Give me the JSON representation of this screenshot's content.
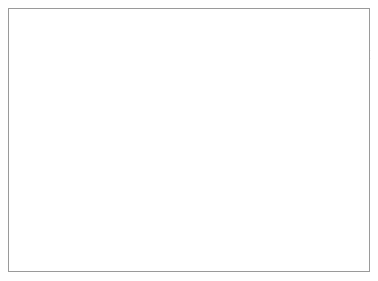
{
  "figure": {
    "kind": "medical-line-drawing",
    "style": "black-and-white pen-and-ink hatching",
    "background_color": "#ffffff",
    "ink_color": "#121212",
    "border_color": "#9a9a9a"
  },
  "labels": {
    "ureters": "Ureters"
  },
  "annotations": {
    "stoma_arrow": {
      "name": "efferent-limb-arrow",
      "direction": "up",
      "meaning": "flow out through stoma"
    },
    "afferent_arrow": {
      "name": "afferent-limb-arrow",
      "direction": "down",
      "meaning": "flow into reservoir"
    }
  },
  "parts": [
    {
      "id": "abdominal-wall-fat",
      "label": "subcutaneous fat layer"
    },
    {
      "id": "abdominal-wall-fascia",
      "label": "fascia and muscle layer"
    },
    {
      "id": "stoma",
      "label": "cutaneous stoma"
    },
    {
      "id": "efferent-nipple-valve",
      "label": "efferent intussuscepted nipple valve"
    },
    {
      "id": "efferent-staple-collar",
      "label": "staple / suture collar"
    },
    {
      "id": "reservoir-pouch",
      "label": "detubularized bowel reservoir"
    },
    {
      "id": "opened-bowel-segment",
      "label": "opened bowel segment with ureteral implants"
    },
    {
      "id": "afferent-nipple-valve",
      "label": "afferent intussuscepted nipple valve"
    },
    {
      "id": "afferent-staple-collar",
      "label": "staple / suture collar"
    },
    {
      "id": "ureter-left",
      "label": "left ureter"
    },
    {
      "id": "ureter-right",
      "label": "right ureter"
    },
    {
      "id": "pouch-suture-line",
      "label": "pouch closure suture line"
    }
  ]
}
